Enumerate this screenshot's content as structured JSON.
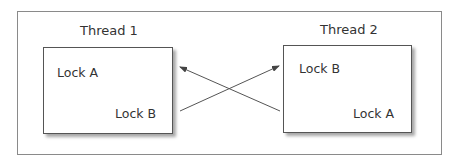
{
  "diagram": {
    "threads": [
      {
        "title": "Thread 1",
        "locks": [
          "Lock A",
          "Lock B"
        ]
      },
      {
        "title": "Thread 2",
        "locks": [
          "Lock B",
          "Lock A"
        ]
      }
    ],
    "arrows": [
      {
        "from": "Thread 2 / Lock A",
        "to": "Thread 1 / Lock A"
      },
      {
        "from": "Thread 1 / Lock B",
        "to": "Thread 2 / Lock B"
      }
    ],
    "colors": {
      "line": "#555555",
      "frame": "#8a8a8a",
      "text": "#333333"
    }
  }
}
